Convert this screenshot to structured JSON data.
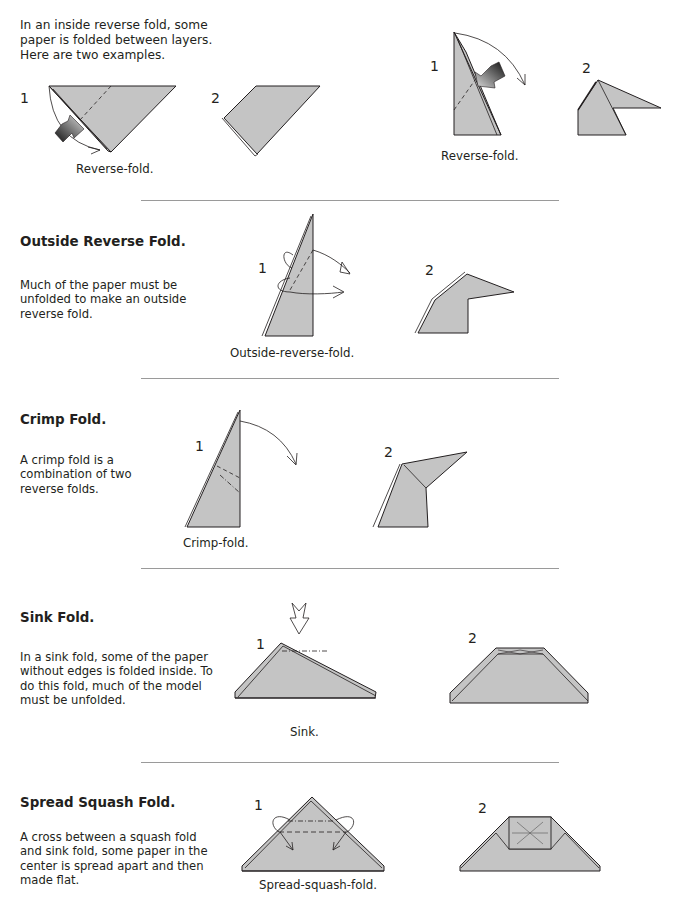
{
  "colors": {
    "paper": "#c4c4c4",
    "outline": "#231f20",
    "divider": "#9a9a9a",
    "text": "#231f20"
  },
  "intro": {
    "text": "In an inside reverse fold, some paper is folded between layers. Here are two examples."
  },
  "inside_reverse": {
    "example_a": {
      "step1": "1",
      "step2": "2",
      "caption": "Reverse-fold."
    },
    "example_b": {
      "step1": "1",
      "step2": "2",
      "caption": "Reverse-fold."
    }
  },
  "sections": [
    {
      "title": "Outside Reverse Fold.",
      "description": "Much of the paper must be unfolded to make an outside reverse fold.",
      "step1": "1",
      "step2": "2",
      "caption": "Outside-reverse-fold."
    },
    {
      "title": "Crimp Fold.",
      "description": "A crimp fold is a combination of two reverse folds.",
      "step1": "1",
      "step2": "2",
      "caption": "Crimp-fold."
    },
    {
      "title": "Sink Fold.",
      "description": "In a sink fold, some of the paper without edges is folded inside. To do this fold, much of the model must be unfolded.",
      "step1": "1",
      "step2": "2",
      "caption": "Sink."
    },
    {
      "title": "Spread Squash Fold.",
      "description": "A cross between a squash fold and sink fold, some paper in the center is spread apart and then made flat.",
      "step1": "1",
      "step2": "2",
      "caption": "Spread-squash-fold."
    }
  ],
  "icons": {
    "push_arrow": "push-arrow-icon",
    "fold_arrow": "curved-fold-arrow-icon",
    "sink_arrow": "hollow-sink-arrow-icon"
  }
}
